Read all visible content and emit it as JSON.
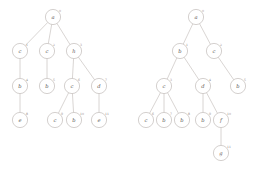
{
  "figure": {
    "background_color": "#ffffff",
    "node_stroke_color": "#b0a9a5",
    "edge_stroke_color": "#b9b2ae",
    "label_color": "#5d5753",
    "index_color": "#8d8682"
  },
  "trees": [
    {
      "name": "left-tree",
      "root_label": "a",
      "node_count": 11,
      "depth": 4,
      "nodes": [
        {
          "id": "L0",
          "label": "a",
          "index": "0",
          "cx": 53,
          "cy": 17,
          "r": 7.6
        },
        {
          "id": "L1",
          "label": "c",
          "index": "1",
          "cx": 20,
          "cy": 51,
          "r": 7.6
        },
        {
          "id": "L2",
          "label": "c",
          "index": "2",
          "cx": 47,
          "cy": 51,
          "r": 7.6
        },
        {
          "id": "L3",
          "label": "h",
          "index": "3",
          "cx": 74,
          "cy": 51,
          "r": 7.6
        },
        {
          "id": "L4",
          "label": "b",
          "index": "4",
          "cx": 20,
          "cy": 86,
          "r": 7.6
        },
        {
          "id": "L5",
          "label": "b",
          "index": "5",
          "cx": 47,
          "cy": 86,
          "r": 7.6
        },
        {
          "id": "L6",
          "label": "c",
          "index": "6",
          "cx": 72,
          "cy": 86,
          "r": 7.6
        },
        {
          "id": "L7",
          "label": "d",
          "index": "7",
          "cx": 99,
          "cy": 86,
          "r": 7.6
        },
        {
          "id": "L8",
          "label": "e",
          "index": "8",
          "cx": 20,
          "cy": 120,
          "r": 7.6
        },
        {
          "id": "L9",
          "label": "c",
          "index": "9",
          "cx": 55,
          "cy": 120,
          "r": 7.6
        },
        {
          "id": "L10",
          "label": "b",
          "index": "10",
          "cx": 74,
          "cy": 120,
          "r": 7.6
        },
        {
          "id": "L11",
          "label": "e",
          "index": "11",
          "cx": 99,
          "cy": 120,
          "r": 7.6
        }
      ],
      "edges": [
        {
          "from": "L0",
          "to": "L1"
        },
        {
          "from": "L0",
          "to": "L2"
        },
        {
          "from": "L0",
          "to": "L3"
        },
        {
          "from": "L1",
          "to": "L4"
        },
        {
          "from": "L2",
          "to": "L5"
        },
        {
          "from": "L3",
          "to": "L6"
        },
        {
          "from": "L3",
          "to": "L7"
        },
        {
          "from": "L4",
          "to": "L8"
        },
        {
          "from": "L6",
          "to": "L9"
        },
        {
          "from": "L6",
          "to": "L10"
        },
        {
          "from": "L7",
          "to": "L11"
        }
      ]
    },
    {
      "name": "right-tree",
      "root_label": "a",
      "node_count": 12,
      "depth": 5,
      "nodes": [
        {
          "id": "R0",
          "label": "a",
          "index": "0",
          "cx": 196,
          "cy": 17,
          "r": 7.6
        },
        {
          "id": "R1",
          "label": "b",
          "index": "1",
          "cx": 180,
          "cy": 51,
          "r": 7.6
        },
        {
          "id": "R2",
          "label": "c",
          "index": "2",
          "cx": 214,
          "cy": 51,
          "r": 7.6
        },
        {
          "id": "R3",
          "label": "c",
          "index": "3",
          "cx": 164,
          "cy": 86,
          "r": 7.6
        },
        {
          "id": "R4",
          "label": "d",
          "index": "4",
          "cx": 203,
          "cy": 86,
          "r": 7.6
        },
        {
          "id": "R5",
          "label": "b",
          "index": "5",
          "cx": 238,
          "cy": 86,
          "r": 7.6
        },
        {
          "id": "R6",
          "label": "c",
          "index": "6",
          "cx": 146,
          "cy": 120,
          "r": 7.6
        },
        {
          "id": "R7",
          "label": "b",
          "index": "7",
          "cx": 164,
          "cy": 120,
          "r": 7.6
        },
        {
          "id": "R8",
          "label": "b",
          "index": "8",
          "cx": 182,
          "cy": 120,
          "r": 7.6
        },
        {
          "id": "R9",
          "label": "b",
          "index": "9",
          "cx": 203,
          "cy": 120,
          "r": 7.6
        },
        {
          "id": "R10",
          "label": "f",
          "index": "10",
          "cx": 221,
          "cy": 120,
          "r": 7.6
        },
        {
          "id": "R11",
          "label": "g",
          "index": "11",
          "cx": 221,
          "cy": 153,
          "r": 7.6
        }
      ],
      "edges": [
        {
          "from": "R0",
          "to": "R1"
        },
        {
          "from": "R0",
          "to": "R2"
        },
        {
          "from": "R1",
          "to": "R3"
        },
        {
          "from": "R1",
          "to": "R4"
        },
        {
          "from": "R2",
          "to": "R5"
        },
        {
          "from": "R3",
          "to": "R6"
        },
        {
          "from": "R3",
          "to": "R7"
        },
        {
          "from": "R3",
          "to": "R8"
        },
        {
          "from": "R4",
          "to": "R9"
        },
        {
          "from": "R4",
          "to": "R10"
        },
        {
          "from": "R10",
          "to": "R11"
        }
      ]
    }
  ]
}
